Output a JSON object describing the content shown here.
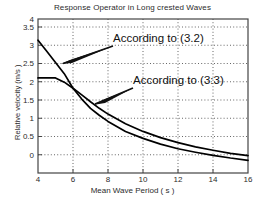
{
  "chart_data": {
    "type": "line",
    "title": "Response Operator in Long crested Waves",
    "xlabel": "Mean Wave Period ( s )",
    "ylabel": "Relative velocity (m/s )",
    "xlim": [
      4,
      16
    ],
    "ylim": [
      0,
      4
    ],
    "xticks": [
      "4",
      "6",
      "8",
      "10",
      "12",
      "14",
      "16"
    ],
    "yticks": [
      "0",
      "0.5",
      "1",
      "1.5",
      "2",
      "2.5",
      "3",
      "3.5",
      "4"
    ],
    "grid": true,
    "legend_position": "none",
    "series": [
      {
        "name": "According to (3.2)",
        "x": [
          4,
          4.5,
          5,
          5.5,
          6,
          6.5,
          7,
          7.5,
          8,
          9,
          10,
          11,
          12,
          13,
          14,
          15,
          16
        ],
        "values": [
          3.45,
          3.16,
          2.87,
          2.58,
          2.2,
          1.92,
          1.68,
          1.5,
          1.34,
          1.08,
          0.9,
          0.75,
          0.63,
          0.54,
          0.46,
          0.39,
          0.33
        ]
      },
      {
        "name": "According to (3:3)",
        "x": [
          4,
          4.5,
          5,
          5.5,
          6,
          6.5,
          7,
          7.5,
          8,
          9,
          10,
          11,
          12,
          13,
          14,
          15,
          16
        ],
        "values": [
          2.47,
          2.47,
          2.47,
          2.36,
          2.2,
          2.03,
          1.85,
          1.68,
          1.53,
          1.28,
          1.08,
          0.92,
          0.79,
          0.68,
          0.59,
          0.51,
          0.45
        ]
      }
    ],
    "annotations": [
      {
        "label": "According to (3.2)",
        "text_x": 113,
        "text_y": 38,
        "arrow_from_x": 113,
        "arrow_from_y": 47,
        "arrow_to_x": 61,
        "arrow_to_y": 64
      },
      {
        "label": "According to (3:3)",
        "text_x": 133,
        "text_y": 81,
        "arrow_from_x": 133,
        "arrow_from_y": 89,
        "arrow_to_x": 93,
        "arrow_to_y": 105
      }
    ],
    "colors": {
      "line": "#000000",
      "grid": "#555555",
      "axis": "#444444",
      "background": "#ffffff"
    }
  }
}
